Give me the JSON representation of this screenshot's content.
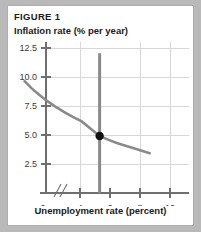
{
  "figure": {
    "label": "FIGURE 1",
    "y_axis_title": "Inflation rate (% per year)",
    "x_axis_title": "Unemployment rate (percent)"
  },
  "colors": {
    "page_background": "#b9b9b9",
    "card_background": "#ffffff",
    "curve": "#8a8a8a",
    "vertical_line": "#8a8a8a",
    "axis": "#6f6f6f",
    "gridline": "#d8d8d8",
    "point": "#111111",
    "text": "#1a1a1a"
  },
  "ticks": {
    "y_labels": [
      "12.5",
      "10.0",
      "7.5",
      "5.0",
      "2.5"
    ],
    "y_values": [
      12.5,
      10.0,
      7.5,
      5.0,
      2.5
    ],
    "x_labels": [
      "0",
      "4",
      "6",
      "8",
      "10"
    ],
    "x_values": [
      0,
      4,
      6,
      8,
      10
    ]
  },
  "chart_data": {
    "type": "line",
    "title": "FIGURE 1",
    "xlabel": "Unemployment rate (percent)",
    "ylabel": "Inflation rate (% per year)",
    "xlim": [
      3,
      11
    ],
    "ylim": [
      0,
      13.5
    ],
    "grid": true,
    "legend": "none",
    "axis_break": {
      "axis": "x",
      "between": [
        0,
        4
      ],
      "style": "double-slash"
    },
    "series": [
      {
        "name": "Short-run Phillips curve",
        "type": "line",
        "x": [
          1.8,
          2.2,
          2.6,
          3.0,
          3.5,
          4.0,
          4.5,
          5.0,
          5.5,
          6.0,
          6.5,
          7.0,
          7.5,
          8.0,
          8.4,
          8.8
        ],
        "y": [
          10.0,
          9.35,
          8.8,
          8.3,
          7.75,
          7.25,
          6.8,
          6.4,
          5.75,
          5.1,
          4.75,
          4.45,
          4.2,
          3.95,
          3.75,
          3.55
        ]
      },
      {
        "name": "Natural rate of unemployment",
        "type": "vline",
        "x": 6.0,
        "y_range": [
          0,
          12.5
        ]
      }
    ],
    "points": [
      {
        "name": "equilibrium-point",
        "x": 6.0,
        "y": 5.1
      }
    ]
  }
}
